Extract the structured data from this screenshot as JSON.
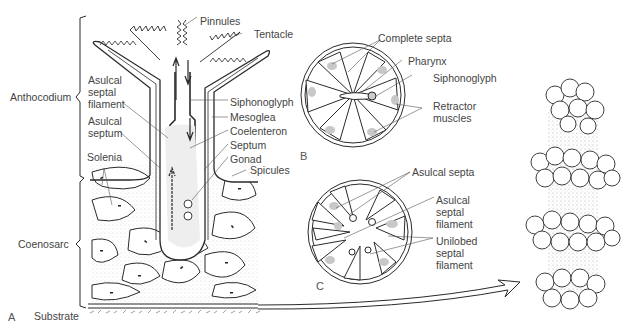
{
  "figure": {
    "panels": [
      {
        "id": "A",
        "label": "A",
        "description": "Longitudinal section of octocoral polyp and coenosarc"
      },
      {
        "id": "B",
        "label": "B",
        "description": "Cross section through pharynx"
      },
      {
        "id": "C",
        "label": "C",
        "description": "Cross section below pharynx"
      }
    ],
    "panel_a_labels": {
      "anthocodium": "Anthocodium",
      "coenosarc": "Coenosarc",
      "substrate": "Substrate",
      "asulcal_septal_filament": "Asulcal\nseptal\nfilament",
      "asulcal_septum": "Asulcal\nseptum",
      "solenia": "Solenia",
      "pinnules": "Pinnules",
      "tentacle": "Tentacle",
      "siphonoglyph": "Siphonoglyph",
      "mesoglea": "Mesoglea",
      "coelenteron": "Coelenteron",
      "septum": "Septum",
      "gonad": "Gonad",
      "spicules": "Spicules"
    },
    "panel_b_labels": {
      "complete_septa": "Complete septa",
      "pharynx": "Pharynx",
      "siphonoglyph": "Siphonoglyph",
      "retractor_muscles": "Retractor\nmuscles"
    },
    "panel_c_labels": {
      "asulcal_septa": "Asulcal septa",
      "asulcal_septal_filament": "Asulcal\nseptal\nfilament",
      "unilobed_septal_filament": "Unilobed\nseptal\nfilament"
    },
    "colors": {
      "line": "#2a2a2a",
      "label": "#444444",
      "shading": "#bdbdbd",
      "background": "#ffffff"
    }
  }
}
